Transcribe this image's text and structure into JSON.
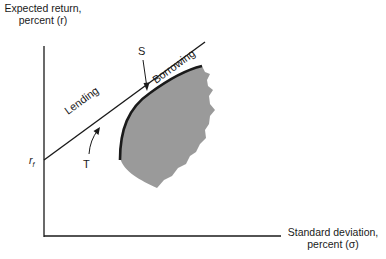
{
  "figure": {
    "y_axis": {
      "label_line1": "Expected return,",
      "label_line2": "percent (r)"
    },
    "x_axis": {
      "label_line1": "Standard deviation,",
      "label_line2": "percent (σ)"
    },
    "risk_free_label": "r",
    "risk_free_subscript": "f",
    "line_labels": {
      "lending": "Lending",
      "borrowing": "Borrowing"
    },
    "point_labels": {
      "tangency": "S",
      "frontier": "T"
    },
    "colors": {
      "ink": "#1a1a1a",
      "shaded_region": "#9a9a9a",
      "background": "#ffffff"
    }
  }
}
